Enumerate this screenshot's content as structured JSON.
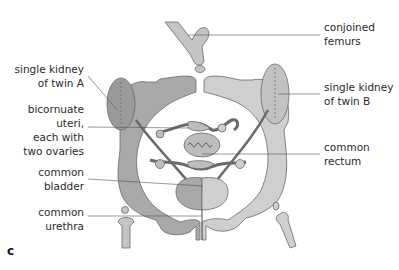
{
  "figure": {
    "panel_label": "c",
    "colors": {
      "twin_a_fill": "#a9a9a9",
      "twin_b_fill": "#cfcfcf",
      "outline": "#6a6a6a",
      "leader_line": "#555555",
      "text": "#2a2a2a"
    },
    "labels_left": [
      {
        "id": "kidney-a",
        "lines": [
          "single kidney",
          "of twin A"
        ]
      },
      {
        "id": "uteri",
        "lines": [
          "bicornuate",
          "uteri,",
          "each with",
          "two ovaries"
        ]
      },
      {
        "id": "bladder",
        "lines": [
          "common",
          "bladder"
        ]
      },
      {
        "id": "urethra",
        "lines": [
          "common",
          "urethra"
        ]
      }
    ],
    "labels_right": [
      {
        "id": "femurs",
        "lines": [
          "conjoined",
          "femurs"
        ]
      },
      {
        "id": "kidney-b",
        "lines": [
          "single kidney",
          "of twin B"
        ]
      },
      {
        "id": "rectum",
        "lines": [
          "common",
          "rectum"
        ]
      }
    ]
  }
}
